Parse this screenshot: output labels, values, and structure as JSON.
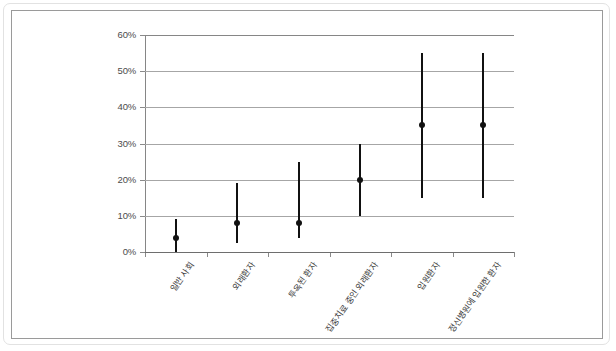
{
  "chart_data": {
    "type": "scatter",
    "title": "",
    "subtitle": "",
    "xlabel": "",
    "ylabel": "",
    "ylim": [
      0,
      60
    ],
    "ytick_labels": [
      "0%",
      "10%",
      "20%",
      "30%",
      "40%",
      "50%",
      "60%"
    ],
    "ytick_values": [
      0,
      10,
      20,
      30,
      40,
      50,
      60
    ],
    "grid": true,
    "legend": "none",
    "categories": [
      "일반 사회",
      "외래환자",
      "투옥된 환자",
      "집중치료 중인 외래환자",
      "입원환자",
      "정신병원에 입원한 환자"
    ],
    "series": [
      {
        "name": "유병률 추정치",
        "values": [
          4,
          8,
          8,
          20,
          35,
          35
        ],
        "low": [
          0,
          2.5,
          4,
          10,
          15,
          15
        ],
        "high": [
          9,
          19,
          25,
          30,
          55,
          55
        ]
      }
    ]
  },
  "axis": {
    "units": "%",
    "y_max_label": "60%",
    "y_min_label": "0%"
  }
}
